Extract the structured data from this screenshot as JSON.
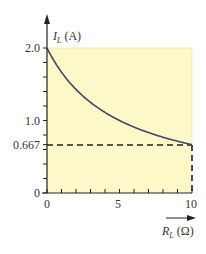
{
  "chart_data": {
    "type": "line",
    "title": "",
    "xlabel": "R_L (Ω)",
    "ylabel": "I_L (A)",
    "xlim": [
      0,
      10
    ],
    "ylim": [
      0,
      2.0
    ],
    "x_ticks": [
      0,
      5,
      10
    ],
    "x_tick_labels": [
      "0",
      "5",
      "10"
    ],
    "x_minor_ticks": [
      1,
      2,
      3,
      4,
      6,
      7,
      8,
      9
    ],
    "y_ticks": [
      0,
      0.667,
      1.0,
      2.0
    ],
    "y_tick_labels": [
      "0",
      "0.667",
      "1.0",
      "2.0"
    ],
    "y_minor_ticks": [
      0.2,
      0.4,
      0.6,
      0.8,
      1.2,
      1.4,
      1.6,
      1.8
    ],
    "grid": false,
    "legend": null,
    "series": [
      {
        "name": "I_L vs R_L",
        "formula": "I_L = 10 / (5 + R_L)",
        "x": [
          0,
          1,
          2,
          3,
          4,
          5,
          6,
          7,
          8,
          9,
          10
        ],
        "values": [
          2.0,
          1.667,
          1.429,
          1.25,
          1.111,
          1.0,
          0.909,
          0.833,
          0.769,
          0.714,
          0.667
        ]
      }
    ],
    "annotations": [
      {
        "type": "dashed-hline",
        "y": 0.667,
        "x_from": 0,
        "x_to": 10,
        "label": "0.667"
      },
      {
        "type": "dashed-vline",
        "x": 10,
        "y_from": 0,
        "y_to": 0.667
      }
    ],
    "colors": {
      "plot_fill": "#FDF8C8",
      "curve": "#3B4A6B",
      "axis": "#222222",
      "dashed": "#222222",
      "text": "#333333"
    }
  },
  "labels": {
    "y_axis_main": "I",
    "y_axis_sub": "L",
    "y_axis_unit": " (A)",
    "x_axis_main": "R",
    "x_axis_sub": "L",
    "x_axis_unit": " (Ω)",
    "y_tick_2": "2.0",
    "y_tick_1": "1.0",
    "y_tick_0667": "0.667",
    "y_tick_0": "0",
    "x_tick_0": "0",
    "x_tick_5": "5",
    "x_tick_10": "10"
  }
}
